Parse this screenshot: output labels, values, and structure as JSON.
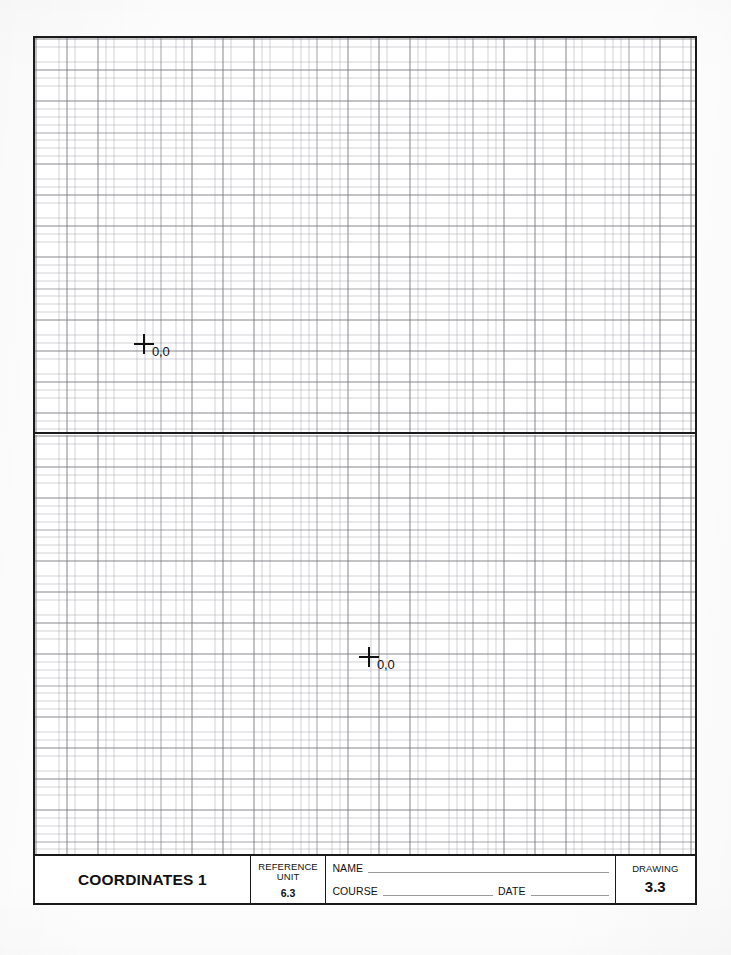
{
  "document": {
    "type": "technical-drawing-worksheet",
    "sheet_title": "COORDINATES 1"
  },
  "graph": {
    "planes": [
      {
        "name": "upper-coordinate-plane",
        "origin_label": "0,0"
      },
      {
        "name": "lower-coordinate-plane",
        "origin_label": "0,0"
      }
    ]
  },
  "title_block": {
    "title": "COORDINATES 1",
    "reference_unit": {
      "label_line1": "REFERENCE",
      "label_line2": "UNIT",
      "value": "6.3"
    },
    "fields": {
      "name_label": "NAME",
      "course_label": "COURSE",
      "date_label": "DATE",
      "name_value": "",
      "course_value": "",
      "date_value": ""
    },
    "drawing": {
      "label": "DRAWING",
      "number": "3.3"
    }
  },
  "colors": {
    "frame": "#1a1a1a",
    "grid_major": "#69696f",
    "grid_minor": "#96969e",
    "rule": "#9a9a9a",
    "text": "#111111",
    "paper": "#fefefe"
  }
}
